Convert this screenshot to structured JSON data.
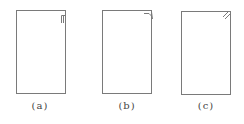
{
  "figure": {
    "stroke_color": "#7a7a7a",
    "panels": [
      {
        "id": "a",
        "label": "(a)",
        "x": 16,
        "y": 10,
        "w": 49,
        "h": 83,
        "corner": "folded-tab"
      },
      {
        "id": "b",
        "label": "(b)",
        "x": 102,
        "y": 10,
        "w": 49,
        "h": 83,
        "corner": "bent-edge"
      },
      {
        "id": "c",
        "label": "(c)",
        "x": 181,
        "y": 11,
        "w": 49,
        "h": 83,
        "corner": "diagonal-strokes"
      }
    ]
  }
}
